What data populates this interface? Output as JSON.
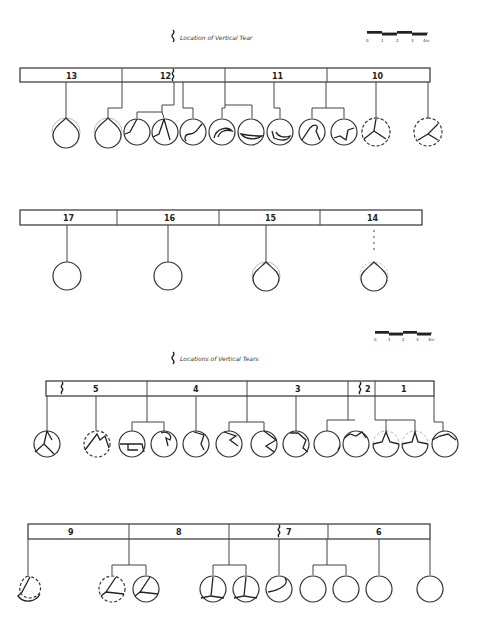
{
  "figure_top": {
    "legend": {
      "symbol": "wavy-line",
      "text": "Location of Vertical Tear"
    },
    "scale_bar": {
      "ticks": [
        "0",
        "1",
        "2",
        "3",
        "4m"
      ]
    },
    "row1": {
      "segments": [
        {
          "label": "13"
        },
        {
          "label": "12"
        },
        {
          "label": "11"
        },
        {
          "label": "10"
        }
      ],
      "sections_count": 12
    },
    "row2": {
      "segments": [
        {
          "label": "17"
        },
        {
          "label": "16"
        },
        {
          "label": "15"
        },
        {
          "label": "14"
        }
      ],
      "sections_count": 4
    }
  },
  "figure_bottom": {
    "legend": {
      "symbol": "wavy-line",
      "text": "Locations of Vertical Tears"
    },
    "scale_bar": {
      "ticks": [
        "0",
        "1",
        "2",
        "3",
        "4m"
      ]
    },
    "row1": {
      "segments": [
        {
          "label": "5"
        },
        {
          "label": "4"
        },
        {
          "label": "3"
        },
        {
          "label": "2"
        },
        {
          "label": "1"
        }
      ],
      "sections_count": 12
    },
    "row2": {
      "segments": [
        {
          "label": "9"
        },
        {
          "label": "8"
        },
        {
          "label": "7"
        },
        {
          "label": "6"
        }
      ],
      "sections_count": 10
    }
  }
}
